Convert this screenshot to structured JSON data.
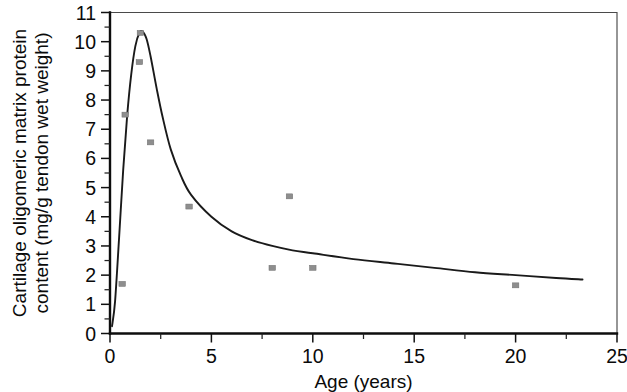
{
  "chart_data": {
    "type": "scatter",
    "title": "",
    "xlabel": "Age (years)",
    "ylabel": "Cartilage oligomeric matrix protein content (mg/g tendon wet weight)",
    "ylabel_line1": "Cartilage oligomeric matrix protein",
    "ylabel_line2": "content (mg/g tendon wet weight)",
    "xlim": [
      0,
      25
    ],
    "ylim": [
      0,
      11
    ],
    "xticks": [
      0,
      5,
      10,
      15,
      20,
      25
    ],
    "yticks": [
      0,
      1,
      2,
      3,
      4,
      5,
      6,
      7,
      8,
      9,
      10,
      11
    ],
    "xtick_labels": [
      "0",
      "5",
      "10",
      "15",
      "20",
      "25"
    ],
    "ytick_labels": [
      "0",
      "1",
      "2",
      "3",
      "4",
      "5",
      "6",
      "7",
      "8",
      "9",
      "10",
      "11"
    ],
    "y_minor_ticks": true,
    "grid": false,
    "legend": null,
    "marker_style": "small filled grey square",
    "marker_color": "#8e8e8e",
    "curve_color": "#1a1a1a",
    "series": [
      {
        "name": "COMP content measurements",
        "type": "scatter",
        "points": [
          {
            "x": 0.6,
            "y": 1.7
          },
          {
            "x": 0.75,
            "y": 7.5
          },
          {
            "x": 1.5,
            "y": 10.3
          },
          {
            "x": 1.45,
            "y": 9.3
          },
          {
            "x": 2.0,
            "y": 6.55
          },
          {
            "x": 3.9,
            "y": 4.35
          },
          {
            "x": 8.0,
            "y": 2.25
          },
          {
            "x": 8.85,
            "y": 4.7
          },
          {
            "x": 10.0,
            "y": 2.25
          },
          {
            "x": 20.0,
            "y": 1.65
          }
        ]
      },
      {
        "name": "Fitted trend curve",
        "type": "line",
        "points": [
          {
            "x": 0.1,
            "y": 0.25
          },
          {
            "x": 0.25,
            "y": 1.1
          },
          {
            "x": 0.45,
            "y": 3.3
          },
          {
            "x": 0.65,
            "y": 5.6
          },
          {
            "x": 0.85,
            "y": 7.5
          },
          {
            "x": 1.05,
            "y": 8.9
          },
          {
            "x": 1.25,
            "y": 9.85
          },
          {
            "x": 1.45,
            "y": 10.3
          },
          {
            "x": 1.6,
            "y": 10.35
          },
          {
            "x": 1.8,
            "y": 10.1
          },
          {
            "x": 2.0,
            "y": 9.5
          },
          {
            "x": 2.3,
            "y": 8.4
          },
          {
            "x": 2.6,
            "y": 7.4
          },
          {
            "x": 3.0,
            "y": 6.3
          },
          {
            "x": 3.5,
            "y": 5.4
          },
          {
            "x": 4.0,
            "y": 4.75
          },
          {
            "x": 5.0,
            "y": 4.0
          },
          {
            "x": 6.0,
            "y": 3.5
          },
          {
            "x": 7.0,
            "y": 3.2
          },
          {
            "x": 8.0,
            "y": 3.0
          },
          {
            "x": 9.0,
            "y": 2.85
          },
          {
            "x": 10.0,
            "y": 2.75
          },
          {
            "x": 12.0,
            "y": 2.55
          },
          {
            "x": 14.0,
            "y": 2.4
          },
          {
            "x": 16.0,
            "y": 2.25
          },
          {
            "x": 18.0,
            "y": 2.1
          },
          {
            "x": 20.0,
            "y": 2.0
          },
          {
            "x": 22.0,
            "y": 1.9
          },
          {
            "x": 23.3,
            "y": 1.85
          }
        ]
      }
    ]
  }
}
